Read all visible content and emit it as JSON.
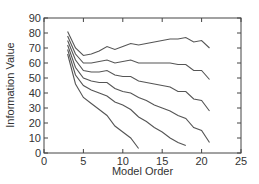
{
  "chart_data": {
    "type": "line",
    "title": "",
    "xlabel": "Model Order",
    "ylabel": "Information Value",
    "xlim": [
      0,
      25
    ],
    "ylim": [
      0,
      90
    ],
    "xticks": [
      0,
      5,
      10,
      15,
      20,
      25
    ],
    "yticks": [
      0,
      10,
      20,
      30,
      40,
      50,
      60,
      70,
      80,
      90
    ],
    "grid": false,
    "legend": null,
    "line_color": "#555555",
    "series": [
      {
        "name": "curve-1",
        "x": [
          3,
          4,
          5,
          6,
          7,
          8,
          9,
          10,
          11,
          12,
          13,
          14,
          15,
          16,
          17,
          18,
          19,
          20,
          21
        ],
        "values": [
          81,
          70,
          65,
          66,
          68,
          71,
          69,
          71,
          73,
          72,
          73,
          74,
          75,
          76,
          76,
          77,
          74,
          75,
          70
        ]
      },
      {
        "name": "curve-2",
        "x": [
          3,
          4,
          5,
          6,
          7,
          8,
          9,
          10,
          11,
          12,
          13,
          14,
          15,
          16,
          17,
          18,
          19,
          20,
          21
        ],
        "values": [
          78,
          66,
          60,
          60,
          61,
          62,
          60,
          61,
          62,
          60,
          60,
          60,
          60,
          60,
          59,
          59,
          55,
          55,
          49
        ]
      },
      {
        "name": "curve-3",
        "x": [
          3,
          4,
          5,
          6,
          7,
          8,
          9,
          10,
          11,
          12,
          13,
          14,
          15,
          16,
          17,
          18,
          19,
          20,
          21
        ],
        "values": [
          75,
          62,
          55,
          54,
          54,
          55,
          52,
          51,
          51,
          48,
          47,
          46,
          45,
          44,
          41,
          41,
          36,
          35,
          28
        ]
      },
      {
        "name": "curve-4",
        "x": [
          3,
          4,
          5,
          6,
          7,
          8,
          9,
          10,
          11,
          12,
          13,
          14,
          15,
          16,
          17,
          18,
          19,
          20,
          21
        ],
        "values": [
          72,
          57,
          50,
          48,
          47,
          47,
          43,
          41,
          40,
          37,
          35,
          32,
          30,
          28,
          25,
          23,
          17,
          15,
          7
        ]
      },
      {
        "name": "curve-5",
        "x": [
          3,
          4,
          5,
          6,
          7,
          8,
          9,
          10,
          11,
          12,
          13,
          14,
          15,
          16,
          17,
          18
        ],
        "values": [
          69,
          52,
          45,
          42,
          40,
          38,
          34,
          32,
          29,
          24,
          21,
          17,
          14,
          10,
          7,
          5
        ]
      },
      {
        "name": "curve-6",
        "x": [
          3,
          4,
          5,
          6,
          7,
          8,
          9,
          10,
          11,
          12
        ],
        "values": [
          66,
          46,
          37,
          33,
          29,
          25,
          18,
          14,
          10,
          3
        ]
      }
    ]
  }
}
